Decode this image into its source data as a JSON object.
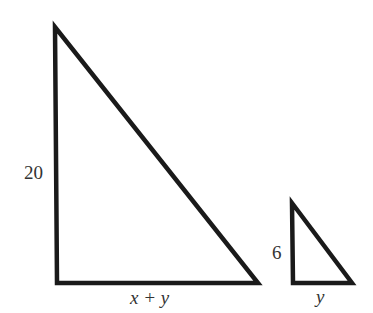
{
  "diagram": {
    "type": "similar-right-triangles",
    "stroke_color": "#1a1a1a",
    "background": "#ffffff",
    "large_triangle": {
      "vertices": {
        "top": [
          55,
          27
        ],
        "bottom_left": [
          57,
          283
        ],
        "bottom_right": [
          258,
          283
        ]
      },
      "vertical_leg_label": "20",
      "horizontal_leg_label": "x + y"
    },
    "small_triangle": {
      "vertices": {
        "top": [
          292,
          203
        ],
        "bottom_left": [
          293,
          283
        ],
        "bottom_right": [
          352,
          283
        ]
      },
      "vertical_leg_label": "6",
      "horizontal_leg_label": "y"
    }
  }
}
